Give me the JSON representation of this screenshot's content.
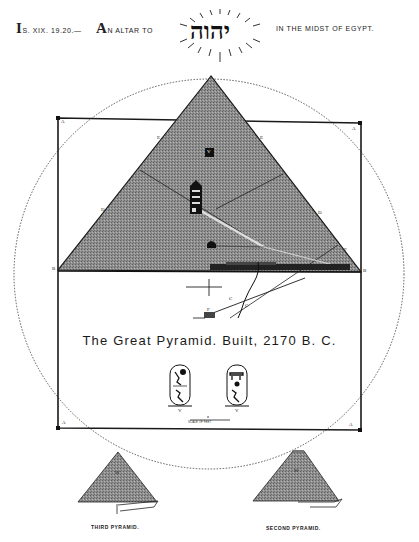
{
  "header": {
    "reference_initial": "I",
    "reference_rest": "S. XIX. 19.20.—",
    "altar_initial": "A",
    "altar_rest": "N ALTAR TO",
    "hebrew_name": "יהוה",
    "midst_text": "IN THE MIDST OF EGYPT."
  },
  "diagram": {
    "title": "The Great Pyramid. Built, 2170 B. C.",
    "corner_labels": {
      "top_left": "A",
      "top_right": "A",
      "bottom_left": "A",
      "bottom_right": "A",
      "apex": "",
      "base_left": "B",
      "base_right": "B"
    },
    "edge_labels": [
      "E",
      "E",
      "D",
      "D",
      "F",
      "C",
      "C",
      "F"
    ],
    "chamber_label": "V",
    "cartouche_labels": [
      "V",
      "V"
    ],
    "scale_label": "SCALE OF FEET"
  },
  "minor_pyramids": [
    {
      "caption": "THIRD PYRAMID.",
      "label": "W"
    },
    {
      "caption": "SECOND PYRAMID.",
      "label": "W"
    }
  ],
  "colors": {
    "ink": "#1a1a1a",
    "pyramid_fill": "#8a8a8a",
    "paper": "#ffffff"
  }
}
